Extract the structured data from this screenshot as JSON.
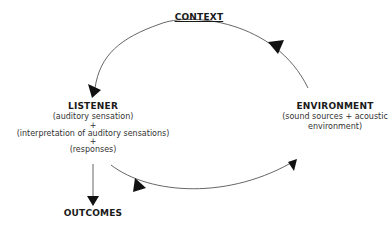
{
  "diagram": {
    "context": {
      "title": "CONTEXT"
    },
    "listener": {
      "title": "LISTENER",
      "lines": [
        "(auditory sensation)",
        "+",
        "(interpretation of auditory sensations)",
        "+",
        "(responses)"
      ]
    },
    "environment": {
      "title": "ENVIRONMENT",
      "lines": [
        "(sound sources + acoustic",
        "environment)"
      ]
    },
    "outcomes": {
      "title": "OUTCOMES"
    },
    "colors": {
      "line": "#555555",
      "arrowhead": "#111111",
      "text": "#1a1a1a"
    }
  }
}
